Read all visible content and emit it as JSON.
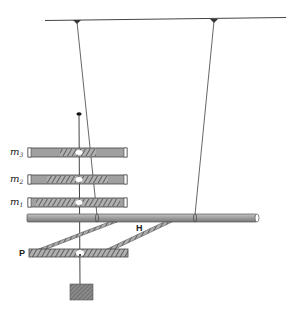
{
  "diagram": {
    "labels": {
      "m3": {
        "base": "m",
        "sub": "3"
      },
      "m2": {
        "base": "m",
        "sub": "2"
      },
      "m1": {
        "base": "m",
        "sub": "1"
      },
      "H": "H",
      "P": "P"
    },
    "colors": {
      "line": "#333333",
      "bar_fill": "#9a9a9a",
      "bar_dark": "#6e6e6e",
      "hatch": "#555555",
      "background": "#ffffff"
    }
  }
}
